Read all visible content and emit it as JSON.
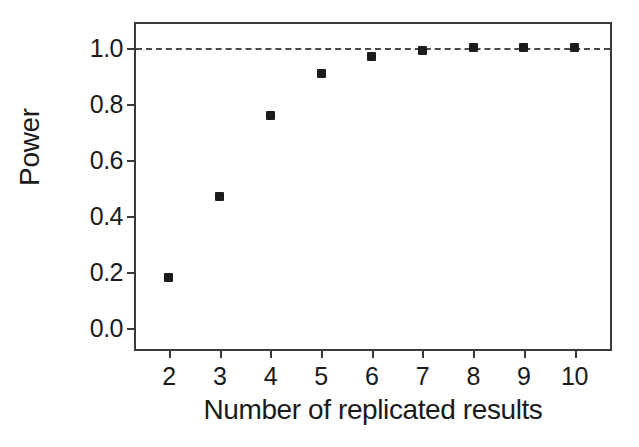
{
  "chart_data": {
    "type": "scatter",
    "title": "",
    "xlabel": "Number of replicated results",
    "ylabel": "Power",
    "x": [
      2,
      3,
      4,
      5,
      6,
      7,
      8,
      9,
      10
    ],
    "values": [
      0.18,
      0.47,
      0.76,
      0.91,
      0.97,
      0.99,
      1.0,
      1.0,
      1.0
    ],
    "series": [
      {
        "name": "Power",
        "marker": "filled-square",
        "color": "#1c1c1c",
        "values": [
          0.18,
          0.47,
          0.76,
          0.91,
          0.97,
          0.99,
          1.0,
          1.0,
          1.0
        ]
      }
    ],
    "xlim": [
      1.35,
      10.7
    ],
    "ylim": [
      -0.075,
      1.085
    ],
    "xticks": [
      2,
      3,
      4,
      5,
      6,
      7,
      8,
      9,
      10
    ],
    "xtick_labels": [
      "2",
      "3",
      "4",
      "5",
      "6",
      "7",
      "8",
      "9",
      "10"
    ],
    "yticks": [
      0.0,
      0.2,
      0.4,
      0.6,
      0.8,
      1.0
    ],
    "ytick_labels": [
      "0.0",
      "0.2",
      "0.4",
      "0.6",
      "0.8",
      "1.0"
    ],
    "grid": false,
    "legend": "none",
    "reference_lines": [
      {
        "name": "power-ceiling",
        "orientation": "horizontal",
        "y": 1.0,
        "style": "dashed",
        "color": "#4a4a4a",
        "label": ""
      }
    ],
    "frame": {
      "box": true,
      "color": "#3a3a3a"
    },
    "background": "#ffffff"
  }
}
